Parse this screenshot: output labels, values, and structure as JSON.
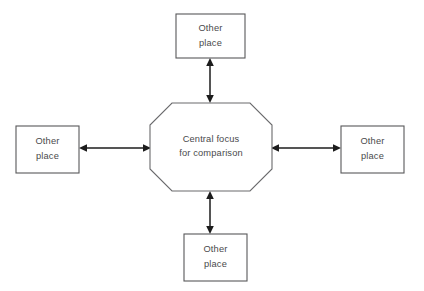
{
  "diagram": {
    "type": "comparison-web",
    "background_color": "#ffffff",
    "stroke_color": "#58585a",
    "arrow_color": "#1c1c1c",
    "text_color": "#4a4a4c",
    "center": {
      "shape": "octagon",
      "line1": "Central focus",
      "line2": "for comparison",
      "x": 150,
      "y": 103,
      "width": 122,
      "height": 88,
      "bevel": 22
    },
    "nodes": [
      {
        "id": "top",
        "shape": "rectangle",
        "line1": "Other",
        "line2": "place",
        "x": 176,
        "y": 14,
        "width": 69,
        "height": 44
      },
      {
        "id": "left",
        "shape": "rectangle",
        "line1": "Other",
        "line2": "place",
        "x": 16,
        "y": 126,
        "width": 63,
        "height": 47
      },
      {
        "id": "right",
        "shape": "rectangle",
        "line1": "Other",
        "line2": "place",
        "x": 341,
        "y": 126,
        "width": 63,
        "height": 47
      },
      {
        "id": "bottom",
        "shape": "rectangle",
        "line1": "Other",
        "line2": "place",
        "x": 184,
        "y": 234,
        "width": 63,
        "height": 47
      }
    ],
    "connectors": [
      {
        "id": "top",
        "orientation": "vertical",
        "double_headed": true,
        "x": 210,
        "from": 58,
        "to": 103
      },
      {
        "id": "left",
        "orientation": "horizontal",
        "double_headed": true,
        "y": 148,
        "from": 79,
        "to": 151
      },
      {
        "id": "right",
        "orientation": "horizontal",
        "double_headed": true,
        "y": 148,
        "from": 271,
        "to": 341
      },
      {
        "id": "bottom",
        "orientation": "vertical",
        "double_headed": true,
        "x": 210,
        "from": 191,
        "to": 234
      }
    ]
  }
}
